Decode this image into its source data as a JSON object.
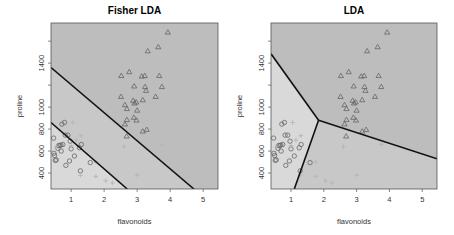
{
  "chart_data": [
    {
      "type": "scatter",
      "title": "Fisher LDA",
      "xlabel": "flavonoids",
      "ylabel": "proline",
      "xlim": [
        0.39,
        5.45
      ],
      "ylim": [
        255,
        1765
      ],
      "xticks": [
        1,
        2,
        3,
        4,
        5
      ],
      "yticks": [
        400,
        600,
        800,
        1000,
        1200,
        1400,
        1600
      ],
      "ytick_labels": [
        "400",
        "600",
        "800",
        "1000",
        "",
        "1400",
        ""
      ],
      "grid": false,
      "regions": [
        {
          "name": "class-2-region",
          "color": "#d9d9d9",
          "polygon": [
            [
              0.39,
              255
            ],
            [
              0.39,
              860
            ],
            [
              2.7,
              255
            ]
          ]
        },
        {
          "name": "class-3-region",
          "color": "#c8c8c8",
          "polygon": [
            [
              0.39,
              860
            ],
            [
              0.39,
              1360
            ],
            [
              4.72,
              255
            ],
            [
              2.7,
              255
            ]
          ]
        },
        {
          "name": "class-1-region",
          "color": "#bdbdbd",
          "polygon": [
            [
              0.39,
              1360
            ],
            [
              0.39,
              1765
            ],
            [
              5.45,
              1765
            ],
            [
              5.45,
              255
            ],
            [
              4.72,
              255
            ]
          ]
        }
      ],
      "boundaries": [
        {
          "from": [
            0.39,
            1360
          ],
          "to": [
            4.72,
            255
          ]
        },
        {
          "from": [
            0.39,
            860
          ],
          "to": [
            2.7,
            255
          ]
        }
      ],
      "series": [
        {
          "name": "class 1",
          "marker": "triangle",
          "points": [
            [
              3.93,
              1680
            ],
            [
              3.32,
              1510
            ],
            [
              3.64,
              1547
            ],
            [
              2.52,
              1285
            ],
            [
              2.76,
              1320
            ],
            [
              3.14,
              1280
            ],
            [
              3.23,
              1285
            ],
            [
              3.67,
              1285
            ],
            [
              2.91,
              1190
            ],
            [
              3.24,
              1185
            ],
            [
              3.27,
              1150
            ],
            [
              3.75,
              1185
            ],
            [
              2.51,
              1095
            ],
            [
              3.17,
              1065
            ],
            [
              3.56,
              1095
            ],
            [
              2.88,
              1060
            ],
            [
              2.92,
              1035
            ],
            [
              2.97,
              1045
            ],
            [
              2.63,
              1020
            ],
            [
              2.69,
              985
            ],
            [
              3.0,
              970
            ],
            [
              2.9,
              905
            ],
            [
              2.98,
              880
            ],
            [
              2.69,
              885
            ],
            [
              2.63,
              845
            ],
            [
              3.29,
              795
            ],
            [
              3.17,
              780
            ],
            [
              2.68,
              735
            ]
          ]
        },
        {
          "name": "class 2",
          "marker": "circle",
          "points": [
            [
              0.47,
              718
            ],
            [
              0.48,
              580
            ],
            [
              0.5,
              560
            ],
            [
              0.52,
              515
            ],
            [
              0.55,
              520
            ],
            [
              0.6,
              625
            ],
            [
              0.62,
              650
            ],
            [
              0.66,
              650
            ],
            [
              0.69,
              655
            ],
            [
              0.7,
              600
            ],
            [
              0.72,
              845
            ],
            [
              0.75,
              660
            ],
            [
              0.8,
              860
            ],
            [
              0.82,
              745
            ],
            [
              0.84,
              470
            ],
            [
              0.9,
              745
            ],
            [
              0.95,
              510
            ],
            [
              0.97,
              690
            ],
            [
              1.0,
              620
            ],
            [
              1.1,
              555
            ],
            [
              1.28,
              420
            ],
            [
              1.31,
              660
            ],
            [
              1.25,
              630
            ],
            [
              1.58,
              495
            ]
          ]
        },
        {
          "name": "class 3",
          "marker": "cross",
          "points": [
            [
              1.28,
              380
            ],
            [
              1.75,
              370
            ],
            [
              2.05,
              330
            ],
            [
              2.25,
              310
            ],
            [
              1.05,
              860
            ],
            [
              1.3,
              740
            ],
            [
              1.15,
              700
            ],
            [
              3.0,
              380
            ],
            [
              3.75,
              660
            ],
            [
              2.6,
              640
            ],
            [
              0.55,
              640
            ],
            [
              1.75,
              500
            ],
            [
              1.0,
              650
            ]
          ]
        }
      ]
    },
    {
      "type": "scatter",
      "title": "LDA",
      "xlabel": "flavonoids",
      "ylabel": "proline",
      "xlim": [
        0.39,
        5.45
      ],
      "ylim": [
        255,
        1765
      ],
      "xticks": [
        1,
        2,
        3,
        4,
        5
      ],
      "yticks": [
        400,
        600,
        800,
        1000,
        1200,
        1400,
        1600
      ],
      "ytick_labels": [
        "400",
        "600",
        "800",
        "1000",
        "",
        "1400",
        ""
      ],
      "grid": false,
      "regions": [
        {
          "name": "class-2-region",
          "color": "#d9d9d9",
          "polygon": [
            [
              0.39,
              255
            ],
            [
              0.39,
              1485
            ],
            [
              1.84,
              880
            ],
            [
              1.1,
              255
            ]
          ]
        },
        {
          "name": "class-3-region",
          "color": "#c8c8c8",
          "polygon": [
            [
              1.1,
              255
            ],
            [
              1.84,
              880
            ],
            [
              5.45,
              530
            ],
            [
              5.45,
              255
            ]
          ]
        },
        {
          "name": "class-1-region",
          "color": "#bdbdbd",
          "polygon": [
            [
              0.39,
              1485
            ],
            [
              0.39,
              1765
            ],
            [
              5.45,
              1765
            ],
            [
              5.45,
              530
            ],
            [
              1.84,
              880
            ]
          ]
        }
      ],
      "boundaries": [
        {
          "from": [
            0.39,
            1485
          ],
          "to": [
            1.84,
            880
          ]
        },
        {
          "from": [
            1.84,
            880
          ],
          "to": [
            5.45,
            530
          ]
        },
        {
          "from": [
            1.84,
            880
          ],
          "to": [
            1.1,
            255
          ]
        }
      ],
      "series_ref": "same as Fisher LDA"
    }
  ],
  "panels": [
    {
      "title": "Fisher LDA",
      "xlabel": "flavonoids",
      "ylabel": "proline"
    },
    {
      "title": "LDA",
      "xlabel": "flavonoids",
      "ylabel": "proline"
    }
  ]
}
